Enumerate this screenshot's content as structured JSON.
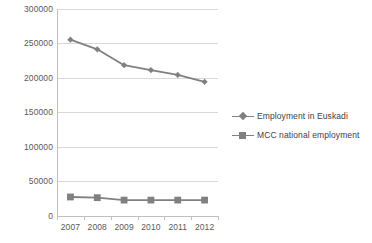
{
  "chart_data": {
    "type": "line",
    "title": "",
    "subtitle": "",
    "xlabel": "",
    "ylabel": "",
    "categories": [
      "2007",
      "2008",
      "2009",
      "2010",
      "2011",
      "2012"
    ],
    "ylim": [
      0,
      300000
    ],
    "ytick_interval": 50000,
    "yticks": [
      "300000",
      "250000",
      "200000",
      "150000",
      "100000",
      "50000",
      "0"
    ],
    "ytick_values": [
      300000,
      250000,
      200000,
      150000,
      100000,
      50000,
      0
    ],
    "grid": true,
    "grid_axis": "y",
    "legend_position": "right",
    "series": [
      {
        "name": "Employment in Euskadi",
        "marker": "diamond",
        "color": "#808080",
        "values": [
          255000,
          241000,
          218000,
          211000,
          204000,
          194000
        ]
      },
      {
        "name": "MCC national employment",
        "marker": "square",
        "color": "#808080",
        "values": [
          27500,
          26500,
          23000,
          23000,
          23000,
          23000
        ]
      }
    ]
  },
  "legend": {
    "items": [
      {
        "label": "Employment in Euskadi"
      },
      {
        "label": "MCC national employment"
      }
    ]
  }
}
